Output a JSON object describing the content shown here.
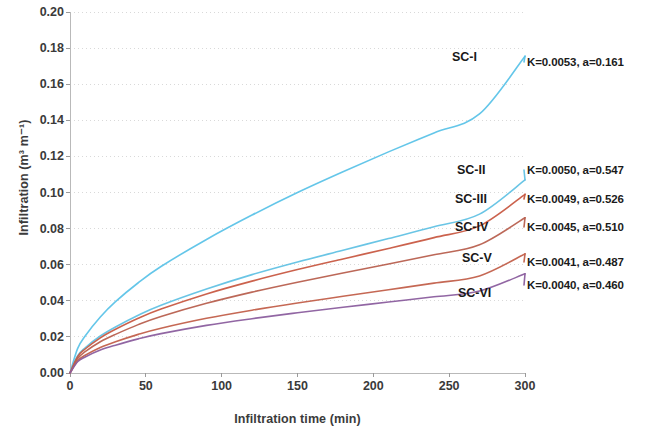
{
  "chart_data": {
    "type": "line",
    "title": "",
    "xlabel": "Infiltration time (min)",
    "ylabel": "Infiltration (m³ m⁻¹)",
    "xlim": [
      0,
      300
    ],
    "ylim": [
      0.0,
      0.2
    ],
    "xticks": [
      0,
      50,
      100,
      150,
      200,
      250,
      300
    ],
    "xtick_labels": [
      "0",
      "50",
      "100",
      "150",
      "200",
      "250",
      "300"
    ],
    "yticks": [
      0.0,
      0.02,
      0.04,
      0.06,
      0.08,
      0.1,
      0.12,
      0.14,
      0.16,
      0.18,
      0.2
    ],
    "ytick_labels": [
      "0.00",
      "0.02",
      "0.04",
      "0.06",
      "0.08",
      "0.10",
      "0.12",
      "0.14",
      "0.16",
      "0.18",
      "0.20"
    ],
    "grid": true,
    "grid_axis": "y",
    "legend_position": "right-inline",
    "model": "Kostiakov: I = K t^a",
    "x": [
      0,
      5,
      10,
      20,
      30,
      45,
      60,
      90,
      120,
      150,
      180,
      210,
      240,
      270,
      300
    ],
    "series": [
      {
        "name": "SC-I",
        "label": "SC-I",
        "annotation": "K=0.0053, a=0.161",
        "K": 0.0053,
        "a": 0.161,
        "color": "#5CC3E8",
        "values": [
          0.0,
          0.0135,
          0.0205,
          0.031,
          0.0395,
          0.05,
          0.059,
          0.074,
          0.0875,
          0.1,
          0.1115,
          0.1225,
          0.133,
          0.1435,
          0.1755
        ]
      },
      {
        "name": "SC-II",
        "label": "SC-II",
        "annotation": "K=0.0050, a=0.547",
        "K": 0.005,
        "a": 0.547,
        "color": "#62C2E4",
        "values": [
          0.0,
          0.0095,
          0.014,
          0.0205,
          0.0255,
          0.032,
          0.0375,
          0.0465,
          0.0545,
          0.0615,
          0.068,
          0.0745,
          0.081,
          0.088,
          0.107
        ]
      },
      {
        "name": "SC-III",
        "label": "SC-III",
        "annotation": "K=0.0049, a=0.526",
        "K": 0.0049,
        "a": 0.526,
        "color": "#C85A43",
        "values": [
          0.0,
          0.009,
          0.0133,
          0.0195,
          0.0242,
          0.0303,
          0.0354,
          0.0438,
          0.0509,
          0.0573,
          0.0632,
          0.069,
          0.075,
          0.0815,
          0.099
        ]
      },
      {
        "name": "SC-IV",
        "label": "SC-IV",
        "annotation": "K=0.0045, a=0.510",
        "K": 0.0045,
        "a": 0.51,
        "color": "#B8604F",
        "values": [
          0.0,
          0.008,
          0.0118,
          0.0173,
          0.0214,
          0.0268,
          0.0313,
          0.0386,
          0.0448,
          0.0503,
          0.0554,
          0.0604,
          0.0655,
          0.071,
          0.086
        ]
      },
      {
        "name": "SC-V",
        "label": "SC-V",
        "annotation": "K=0.0041, a=0.487",
        "K": 0.0041,
        "a": 0.487,
        "color": "#C2604B",
        "values": [
          0.0,
          0.0068,
          0.0098,
          0.0141,
          0.0173,
          0.0214,
          0.0248,
          0.0303,
          0.0348,
          0.0388,
          0.0425,
          0.0461,
          0.0498,
          0.0538,
          0.066
        ]
      },
      {
        "name": "SC-VI",
        "label": "SC-VI",
        "annotation": "K=0.0040, a=0.460",
        "K": 0.004,
        "a": 0.46,
        "color": "#8B5E9E",
        "values": [
          0.0,
          0.0062,
          0.0089,
          0.0127,
          0.0154,
          0.0189,
          0.0218,
          0.0264,
          0.0301,
          0.0334,
          0.0364,
          0.0393,
          0.0422,
          0.0454,
          0.055
        ]
      }
    ]
  },
  "axes": {
    "y_title": "Infiltration (m³ m⁻¹)",
    "x_title": "Infiltration time (min)"
  }
}
